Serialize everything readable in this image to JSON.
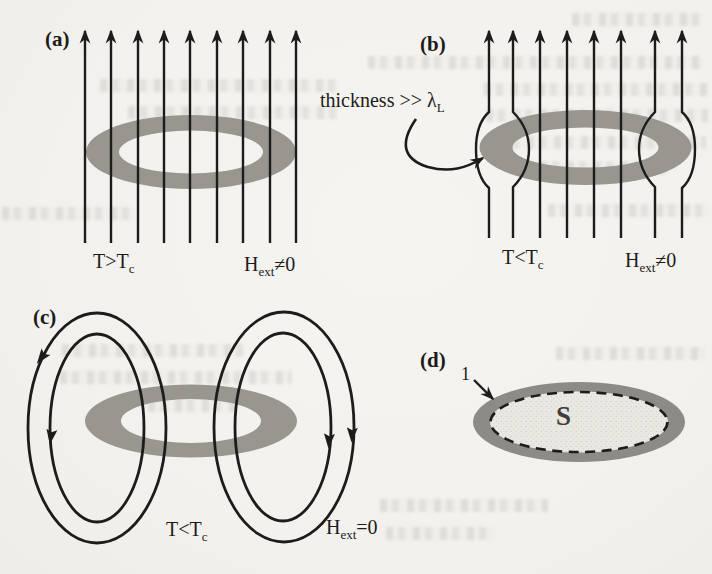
{
  "colors": {
    "ring_gray": "#98968f",
    "band_gray": "#8d8b85",
    "surface_fill": "#e9e8e2",
    "ink": "#1d1c1a"
  },
  "panels": {
    "a": {
      "label": "(a)",
      "temp_pre": "T>T",
      "temp_sub": "c",
      "field_pre": "H",
      "field_sub": "ext",
      "field_post": "≠0"
    },
    "b": {
      "label": "(b)",
      "annotation_pre": "thickness >> λ",
      "annotation_sub": "L",
      "temp_pre": "T<T",
      "temp_sub": "c",
      "field_pre": "H",
      "field_sub": "ext",
      "field_post": "≠0"
    },
    "c": {
      "label": "(c)",
      "temp_pre": "T<T",
      "temp_sub": "c",
      "field_pre": "H",
      "field_sub": "ext",
      "field_post": "=0"
    },
    "d": {
      "label": "(d)",
      "contour_label": "1",
      "surface_label": "S"
    }
  }
}
